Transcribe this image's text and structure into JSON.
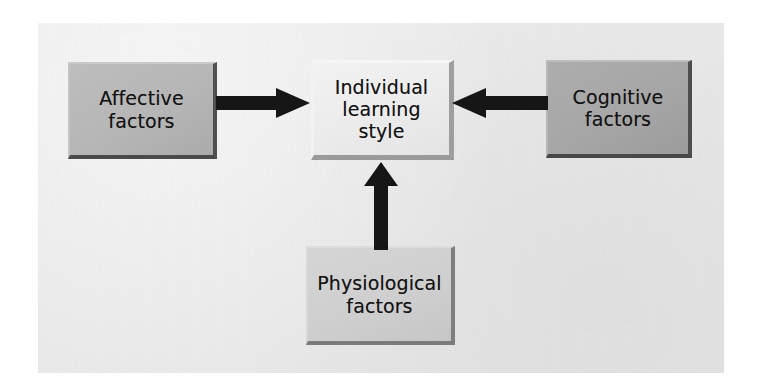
{
  "figure": {
    "background_color": "#eaeaea",
    "page_color": "#ffffff"
  },
  "nodes": [
    {
      "id": "affective",
      "label": "Affective\nfactors",
      "role": "input-factor",
      "fill_color": "#b6b6b6",
      "text_color": "#121212"
    },
    {
      "id": "individual",
      "label": "Individual\nlearning\nstyle",
      "role": "central-outcome",
      "fill_color": "#ececec",
      "text_color": "#121212"
    },
    {
      "id": "cognitive",
      "label": "Cognitive\nfactors",
      "role": "input-factor",
      "fill_color": "#a6a6a6",
      "text_color": "#121212"
    },
    {
      "id": "physiological",
      "label": "Physiological\nfactors",
      "role": "input-factor",
      "fill_color": "#cfcfcf",
      "text_color": "#121212"
    }
  ],
  "arrows": [
    {
      "id": "affective-to-center",
      "from": "affective",
      "to": "individual",
      "direction": "right",
      "color": "#161616"
    },
    {
      "id": "cognitive-to-center",
      "from": "cognitive",
      "to": "individual",
      "direction": "left",
      "color": "#161616"
    },
    {
      "id": "physiological-to-center",
      "from": "physiological",
      "to": "individual",
      "direction": "up",
      "color": "#161616"
    }
  ]
}
